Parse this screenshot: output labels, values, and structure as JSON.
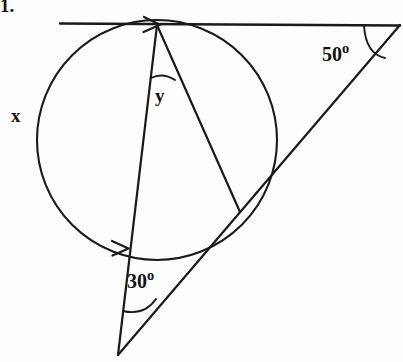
{
  "figure": {
    "item_number": "1.",
    "stroke_color": "#1a1a1a",
    "background_color": "#fdfdfc"
  },
  "labels": {
    "arc_x": "x",
    "angle_y": "y",
    "angle_50": "50",
    "angle_30": "30",
    "degree_symbol": "o"
  },
  "geometry": {
    "circle": {
      "cx": 157,
      "cy": 140,
      "r": 120
    },
    "tangent_point": {
      "x": 157,
      "y": 25
    },
    "tangent_line": {
      "x1": 60,
      "y1": 23,
      "x2": 400,
      "y2": 25
    },
    "right_vertex": {
      "x": 400,
      "y": 25
    },
    "bottom_vertex": {
      "x": 118,
      "y": 355
    },
    "chord_end_lower_left": {
      "x": 125,
      "y": 248
    },
    "chord_end_right": {
      "x": 240,
      "y": 212
    },
    "secant_crossing": {
      "x": 232,
      "y": 217
    }
  }
}
